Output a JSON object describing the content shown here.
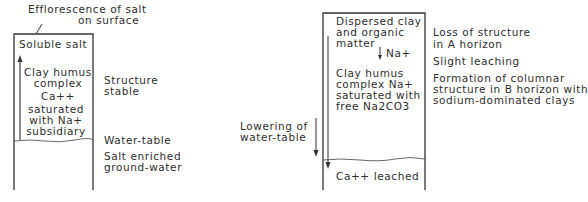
{
  "left_profile": {
    "caption_top": [
      "Efflorescence  of  salt",
      "on  surface"
    ],
    "box_upper": {
      "lines": [
        "Soluble  salt",
        "Clay  humus",
        "complex",
        "Ca++",
        "saturated",
        "with  Na+",
        "subsidiary"
      ]
    },
    "side_labels": {
      "structure": [
        "Structure",
        "stable"
      ],
      "water_table": "Water-table",
      "groundwater": [
        "Salt  enriched",
        "ground-water"
      ]
    }
  },
  "right_profile": {
    "box_upper": {
      "lines": [
        "Dispersed  clay",
        "and  organic",
        "matter",
        "Na+",
        "Clay  humus",
        "complex  Na+",
        "saturated  with",
        "free  Na2CO3"
      ]
    },
    "box_lower": "Ca++  leached",
    "left_label": [
      "Lowering  of",
      "water-table"
    ],
    "side_labels": [
      [
        "Loss  of  structure",
        "in  A  horizon"
      ],
      [
        "Slight  leaching"
      ],
      [
        "Formation  of  columnar",
        "structure  in  B  horizon  with",
        "sodium-dominated  clays"
      ]
    ]
  }
}
